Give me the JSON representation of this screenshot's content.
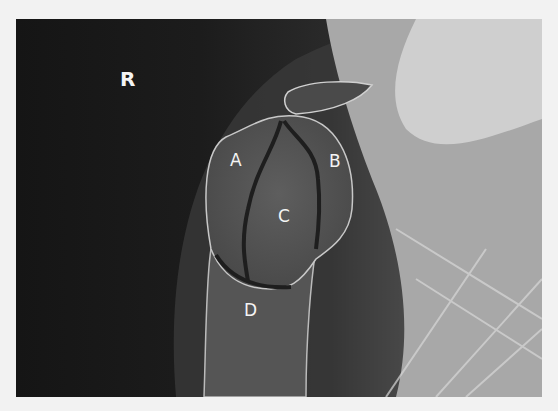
{
  "image": {
    "type": "shoulder radiograph",
    "side_marker": "R",
    "labels": [
      {
        "id": "A",
        "text": "A"
      },
      {
        "id": "B",
        "text": "B"
      },
      {
        "id": "C",
        "text": "C"
      },
      {
        "id": "D",
        "text": "D"
      }
    ]
  }
}
